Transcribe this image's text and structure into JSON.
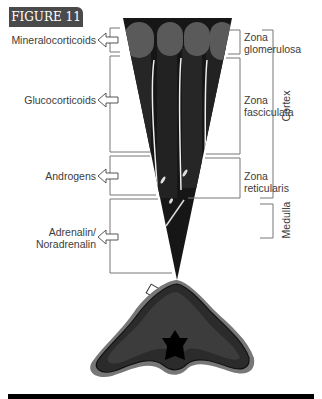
{
  "figure": {
    "tag": "FIGURE 11"
  },
  "hormones": [
    {
      "label": "Mineralocorticoids"
    },
    {
      "label": "Glucocorticoids"
    },
    {
      "label": "Androgens"
    },
    {
      "label": "Adrenalin/\nNoradrenalin",
      "line1": "Adrenalin/",
      "line2": "Noradrenalin"
    }
  ],
  "zones": [
    {
      "line1": "Zona",
      "line2": "glomerulosa"
    },
    {
      "line1": "Zona",
      "line2": "fasciculata"
    },
    {
      "line1": "Zona",
      "line2": "reticularis"
    }
  ],
  "regions": {
    "cortex": "Cortex",
    "medulla": "Medulla"
  },
  "colors": {
    "tag_bg": "#4a4a4a",
    "line": "#777777",
    "tissue_dark": "#1a1a1a",
    "glomerulosa": "#555555"
  }
}
